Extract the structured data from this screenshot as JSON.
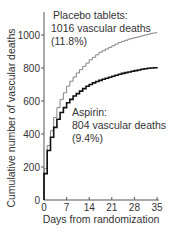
{
  "chart_data": {
    "type": "line",
    "title": "",
    "xlabel": "Days from randomization",
    "ylabel": "Cumulative number of vascular deaths",
    "xlim": [
      0,
      35
    ],
    "ylim": [
      0,
      1100
    ],
    "x_ticks": [
      0,
      7,
      14,
      21,
      28,
      35
    ],
    "y_ticks": [
      0,
      200,
      400,
      600,
      800,
      1000
    ],
    "grid": false,
    "legend": "inline annotations",
    "series": [
      {
        "name": "Placebo tablets",
        "style": "thin grey step line",
        "color": "#777777",
        "x": [
          0,
          1,
          2,
          3,
          4,
          5,
          6,
          7,
          8,
          9,
          10,
          11,
          12,
          13,
          14,
          15,
          16,
          17,
          18,
          19,
          20,
          21,
          22,
          23,
          24,
          25,
          26,
          27,
          28,
          29,
          30,
          31,
          32,
          33,
          34,
          35
        ],
        "values": [
          190,
          330,
          420,
          500,
          560,
          610,
          650,
          690,
          720,
          745,
          770,
          790,
          810,
          830,
          850,
          865,
          880,
          895,
          905,
          915,
          925,
          935,
          945,
          955,
          962,
          968,
          975,
          980,
          985,
          990,
          995,
          1000,
          1005,
          1010,
          1013,
          1016
        ]
      },
      {
        "name": "Aspirin",
        "style": "thick black step line",
        "color": "#111111",
        "x": [
          0,
          1,
          2,
          3,
          4,
          5,
          6,
          7,
          8,
          9,
          10,
          11,
          12,
          13,
          14,
          15,
          16,
          17,
          18,
          19,
          20,
          21,
          22,
          23,
          24,
          25,
          26,
          27,
          28,
          29,
          30,
          31,
          32,
          33,
          34,
          35
        ],
        "values": [
          160,
          300,
          380,
          440,
          490,
          530,
          560,
          590,
          610,
          630,
          645,
          660,
          675,
          690,
          700,
          710,
          718,
          725,
          732,
          738,
          744,
          750,
          756,
          762,
          767,
          772,
          776,
          780,
          784,
          788,
          792,
          795,
          798,
          800,
          802,
          804
        ]
      }
    ],
    "annotations": [
      {
        "lines": [
          "Placebo tablets:",
          "1016 vascular deaths",
          "(11.8%)"
        ]
      },
      {
        "lines": [
          "Aspirin:",
          "804 vascular deaths",
          "(9.4%)"
        ]
      }
    ]
  },
  "labels": {
    "y_axis": "Cumulative number of vascular deaths",
    "x_axis": "Days from randomization",
    "placebo_line1": "Placebo tablets:",
    "placebo_line2": "1016 vascular deaths",
    "placebo_line3": "(11.8%)",
    "aspirin_line1": "Aspirin:",
    "aspirin_line2": "804 vascular deaths",
    "aspirin_line3": "(9.4%)"
  }
}
